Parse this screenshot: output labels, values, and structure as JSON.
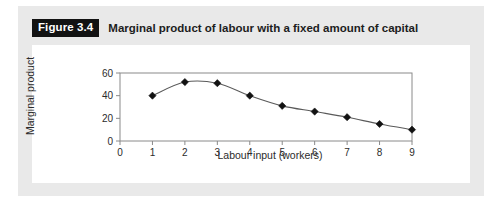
{
  "figure": {
    "tag": "Figure 3.4",
    "title": "Marginal product of labour with a fixed amount of capital"
  },
  "colors": {
    "card_background": "#e9e9e9",
    "panel_background": "#ffffff",
    "axis": "#8a8a8a",
    "line": "#5a5a5a",
    "marker": "#121212",
    "tag_background": "#121212",
    "tag_text": "#ffffff",
    "text": "#2b2b2b"
  },
  "chart_data": {
    "type": "line",
    "title": "Marginal product of labour with a fixed amount of capital",
    "xlabel": "Labour input (workers)",
    "ylabel": "Marginal product",
    "x": [
      1,
      2,
      3,
      4,
      5,
      6,
      7,
      8,
      9
    ],
    "values": [
      40,
      52,
      51,
      40,
      31,
      26,
      21,
      15,
      10
    ],
    "series": [
      {
        "name": "Marginal product",
        "values": [
          40,
          52,
          51,
          40,
          31,
          26,
          21,
          15,
          10
        ]
      }
    ],
    "xlim": [
      0,
      9
    ],
    "ylim": [
      0,
      60
    ],
    "xticks": [
      0,
      1,
      2,
      3,
      4,
      5,
      6,
      7,
      8,
      9
    ],
    "xtick_labels": [
      "0",
      "1",
      "2",
      "3",
      "4",
      "5",
      "6",
      "7",
      "8",
      "9"
    ],
    "yticks": [
      0,
      20,
      40,
      60
    ],
    "ytick_labels": [
      "0",
      "20",
      "40",
      "60"
    ],
    "grid": false,
    "legend": null,
    "marker": "diamond",
    "smooth": true
  }
}
